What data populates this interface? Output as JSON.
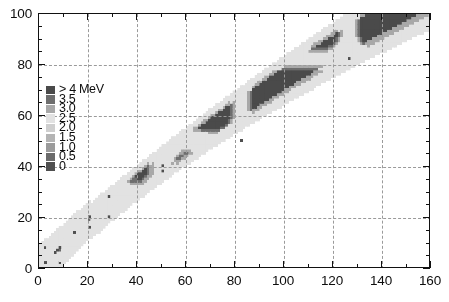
{
  "chart_data": {
    "type": "heatmap",
    "title": "",
    "xlabel": "",
    "ylabel": "",
    "xlim": [
      0,
      160
    ],
    "ylim": [
      0,
      100
    ],
    "xticks": [
      0,
      20,
      40,
      60,
      80,
      100,
      120,
      140,
      160
    ],
    "yticks": [
      0,
      20,
      40,
      60,
      80,
      100
    ],
    "x_minor_step": 10,
    "y_minor_step": 5,
    "grid": true,
    "grid_style": "dashed",
    "grid_color": "#9a9a9a",
    "cell_size": [
      1,
      1
    ],
    "legend_position": "inside-upper-left",
    "legend_title": "> 4 MeV",
    "colorbar_levels": [
      {
        "label": "> 4 MeV",
        "value": 4.0,
        "color": "#4a4a4a"
      },
      {
        "label": "3.5",
        "value": 3.5,
        "color": "#6e6e6e"
      },
      {
        "label": "3.0",
        "value": 3.0,
        "color": "#a8a8a8"
      },
      {
        "label": "2.5",
        "value": 2.5,
        "color": "#e2e2e2"
      },
      {
        "label": "2.0",
        "value": 2.0,
        "color": "#cfcfcf"
      },
      {
        "label": "1.5",
        "value": 1.5,
        "color": "#b4b4b4"
      },
      {
        "label": "1.0",
        "value": 1.0,
        "color": "#9b9b9b"
      },
      {
        "label": "0.5",
        "value": 0.5,
        "color": "#6a6a6a"
      },
      {
        "label": "0",
        "value": 0.0,
        "color": "#4f4f4f"
      }
    ],
    "background_color": "#ffffff",
    "axis_color": "#111111"
  },
  "caption": {
    "text": ""
  }
}
